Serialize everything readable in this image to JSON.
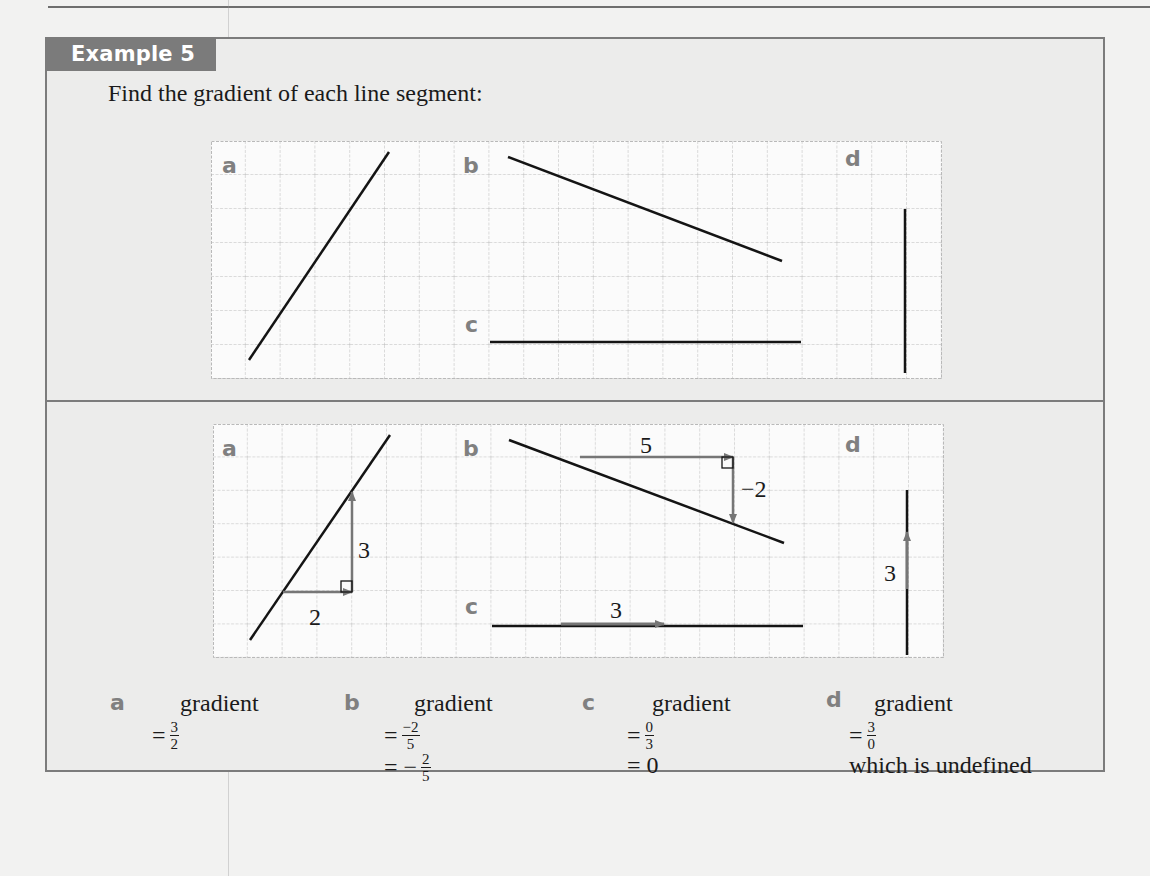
{
  "example": {
    "tab_label": "Example 5",
    "question": "Find the gradient of each line segment:"
  },
  "diagrams": {
    "labels": [
      "a",
      "b",
      "c",
      "d"
    ],
    "solution": {
      "a": {
        "run": "2",
        "rise": "3"
      },
      "b": {
        "run": "5",
        "rise": "−2"
      },
      "c": {
        "run": "3"
      },
      "d": {
        "rise": "3"
      }
    }
  },
  "answers": [
    {
      "label": "a",
      "heading": "gradient",
      "steps": [
        {
          "prefix": "=",
          "num": "3",
          "den": "2"
        }
      ]
    },
    {
      "label": "b",
      "heading": "gradient",
      "steps": [
        {
          "prefix": "=",
          "num": "−2",
          "den": "5"
        },
        {
          "prefix": "= −",
          "num": "2",
          "den": "5"
        }
      ]
    },
    {
      "label": "c",
      "heading": "gradient",
      "steps": [
        {
          "prefix": "=",
          "num": "0",
          "den": "3"
        },
        {
          "text": "= 0"
        }
      ]
    },
    {
      "label": "d",
      "heading": "gradient",
      "steps": [
        {
          "prefix": "=",
          "num": "3",
          "den": "0"
        },
        {
          "text": "which is undefined"
        }
      ]
    }
  ],
  "colors": {
    "tab_bg": "#7b7b7b",
    "box_bg": "#ececeb",
    "grid_line": "#b9b9b9",
    "segment": "#141414",
    "construction": "#767676",
    "label": "#808080"
  }
}
